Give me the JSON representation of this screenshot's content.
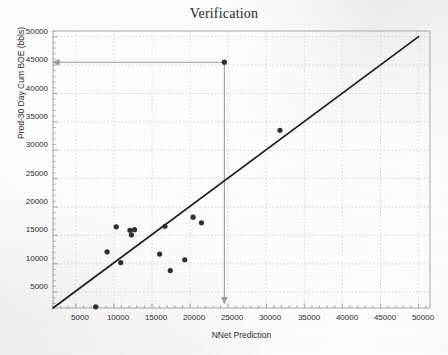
{
  "chart_data": {
    "type": "scatter",
    "title": "Verification",
    "xlabel": "NNet Prediction",
    "ylabel": "Prod-30 Day Cum BOE (bbls)",
    "xlim": [
      2000,
      51500
    ],
    "ylim": [
      2200,
      51000
    ],
    "xticks": [
      5000,
      10000,
      15000,
      20000,
      25000,
      30000,
      35000,
      40000,
      45000,
      50000
    ],
    "yticks": [
      5000,
      10000,
      15000,
      20000,
      25000,
      30000,
      35000,
      40000,
      45000,
      50000
    ],
    "xtick_labels": [
      "5000",
      "10000",
      "15000",
      "20000",
      "25000",
      "30000",
      "35000",
      "40000",
      "45000",
      "50000"
    ],
    "ytick_labels": [
      "5000",
      "10000",
      "15000",
      "20000",
      "25000",
      "30000",
      "35000",
      "40000",
      "45000",
      "50000"
    ],
    "grid": true,
    "grid_style": "dotted",
    "legend": null,
    "series": [
      {
        "name": "wells",
        "marker": "filled-circle",
        "color": "#2e2e2e",
        "points": [
          {
            "x": 7600,
            "y": 2400
          },
          {
            "x": 9100,
            "y": 12100
          },
          {
            "x": 10300,
            "y": 16500
          },
          {
            "x": 10900,
            "y": 10200
          },
          {
            "x": 12100,
            "y": 15900
          },
          {
            "x": 12300,
            "y": 15100
          },
          {
            "x": 12700,
            "y": 16000
          },
          {
            "x": 16000,
            "y": 11700
          },
          {
            "x": 16700,
            "y": 16600
          },
          {
            "x": 17400,
            "y": 8800
          },
          {
            "x": 19300,
            "y": 10700
          },
          {
            "x": 20400,
            "y": 18200
          },
          {
            "x": 21500,
            "y": 17200
          },
          {
            "x": 24500,
            "y": 45500
          },
          {
            "x": 31800,
            "y": 33500
          }
        ]
      }
    ],
    "reference_line": {
      "name": "one-to-one-line",
      "from": {
        "x": 2000,
        "y": 2200
      },
      "to": {
        "x": 50000,
        "y": 50000
      },
      "color": "#1f1f1f"
    },
    "annotations": [
      {
        "name": "horizontal-callout-arrow",
        "type": "arrow",
        "color": "#9a9a9a",
        "from": {
          "x": 24500,
          "y": 45500
        },
        "to": {
          "x": 2000,
          "y": 45500
        }
      },
      {
        "name": "vertical-callout-arrow",
        "type": "arrow",
        "color": "#9a9a9a",
        "from": {
          "x": 24500,
          "y": 45500
        },
        "to": {
          "x": 24500,
          "y": 3000
        }
      }
    ],
    "colors": {
      "marker": "#2e2e2e",
      "reference_line": "#1f1f1f",
      "grid": "#c9c9c9",
      "axis": "#8d8d8d",
      "annotation": "#9a9a9a",
      "background": "#f2f2f0",
      "text": "#2b2b2b"
    }
  }
}
